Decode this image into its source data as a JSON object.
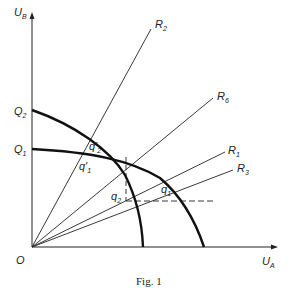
{
  "figure": {
    "caption": "Fig. 1",
    "axes": {
      "x_label": {
        "main": "U",
        "sub": "A"
      },
      "y_label": {
        "main": "U",
        "sub": "B"
      },
      "origin_label": "O"
    },
    "curves": [
      {
        "name": "Q2",
        "label": {
          "main": "Q",
          "sub": "2"
        }
      },
      {
        "name": "Q1",
        "label": {
          "main": "Q",
          "sub": "1"
        }
      }
    ],
    "rays": [
      {
        "name": "R2",
        "label": {
          "main": "R",
          "sub": "2"
        }
      },
      {
        "name": "R6",
        "label": {
          "main": "R",
          "sub": "6"
        }
      },
      {
        "name": "R1",
        "label": {
          "main": "R",
          "sub": "1"
        }
      },
      {
        "name": "R3",
        "label": {
          "main": "R",
          "sub": "3"
        }
      }
    ],
    "points": [
      {
        "name": "q2-prime",
        "label": {
          "main": "q'",
          "sub": "2"
        }
      },
      {
        "name": "q1-prime",
        "label": {
          "main": "q'",
          "sub": "1"
        }
      },
      {
        "name": "q2",
        "label": {
          "main": "q",
          "sub": "2"
        }
      },
      {
        "name": "q1",
        "label": {
          "main": "q",
          "sub": "1"
        }
      }
    ]
  }
}
